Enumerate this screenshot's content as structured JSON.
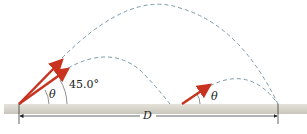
{
  "diagram": {
    "labels": {
      "theta_left": "θ",
      "angle_45": "45.0°",
      "theta_right": "θ",
      "distance": "D"
    },
    "colors": {
      "arrow": "#c8321e",
      "trajectory": "#7a9aaa",
      "ground": "#d8d6cc"
    }
  }
}
